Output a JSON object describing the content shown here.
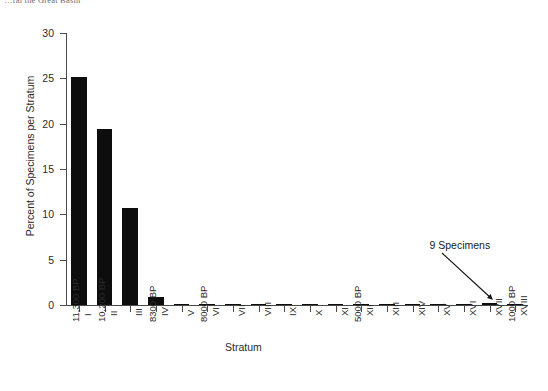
{
  "caption_fragment": "…ral the Great Basin",
  "chart_data": {
    "type": "bar",
    "title": "",
    "xlabel": "Stratum",
    "ylabel": "Percent of Specimens per Stratum",
    "ylim": [
      0,
      30
    ],
    "yticks": [
      0,
      5,
      10,
      15,
      20,
      25,
      30
    ],
    "ytick_labels": [
      "0",
      "5",
      "10",
      "15",
      "20",
      "25",
      "30"
    ],
    "grid": false,
    "legend": "none",
    "bar_color": "#0d0d0d",
    "categories": [
      "I",
      "II",
      "III",
      "IV",
      "V",
      "VI",
      "VII",
      "VIII",
      "IX",
      "X",
      "XI",
      "XII",
      "XIII",
      "XIV",
      "XV",
      "XVI",
      "XVII",
      "XVIII"
    ],
    "values": [
      25.1,
      19.4,
      10.7,
      0.9,
      0.1,
      0.15,
      0.1,
      0.15,
      0.05,
      0.1,
      0.1,
      0.05,
      0.05,
      0.05,
      0.05,
      0.05,
      0.25,
      0.05
    ],
    "date_labels": [
      {
        "category": "I",
        "text": "11,300 BP"
      },
      {
        "category": "II",
        "text": "10,200 BP"
      },
      {
        "category": "IV",
        "text": "8300 BP"
      },
      {
        "category": "VI",
        "text": "8000 BP"
      },
      {
        "category": "XII",
        "text": "5000 BP"
      },
      {
        "category": "XVIII",
        "text": "1000 BP"
      }
    ],
    "annotations": [
      {
        "text": "9 Specimens",
        "points_to_category": "XVII"
      }
    ]
  }
}
